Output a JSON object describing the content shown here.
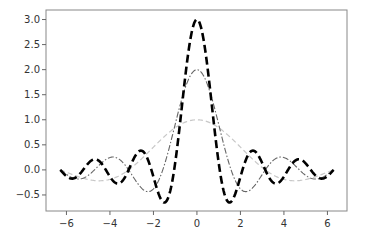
{
  "chart_data": {
    "type": "line",
    "title": "",
    "xlabel": "",
    "ylabel": "",
    "xlim": [
      -6.94,
      6.9
    ],
    "ylim": [
      -0.82,
      3.19
    ],
    "grid": false,
    "legend": null,
    "x_ticks": [
      -6,
      -4,
      -2,
      0,
      2,
      4,
      6
    ],
    "x_tick_labels": [
      "−6",
      "−4",
      "−2",
      "0",
      "2",
      "4",
      "6"
    ],
    "y_ticks": [
      -0.5,
      0.0,
      0.5,
      1.0,
      1.5,
      2.0,
      2.5,
      3.0
    ],
    "y_tick_labels": [
      "−0.5",
      "0.0",
      "0.5",
      "1.0",
      "1.5",
      "2.0",
      "2.5",
      "3.0"
    ],
    "x_range": [
      -6.2832,
      6.2832
    ],
    "series": [
      {
        "name": "sin(x)/x",
        "style": "dashed",
        "color": "#c8c8c8",
        "linewidth": 1.2,
        "dasharray": "5,3",
        "function": "sin(1*x)/x",
        "k": 1,
        "peak": 1.0
      },
      {
        "name": "sin(2x)/x",
        "style": "dashdot",
        "color": "#666666",
        "linewidth": 1.1,
        "dasharray": "6,2,1.5,2",
        "function": "sin(2*x)/x",
        "k": 2,
        "peak": 2.0
      },
      {
        "name": "sin(3x)/x",
        "style": "dashed",
        "color": "#000000",
        "linewidth": 2.6,
        "dasharray": "8,4",
        "function": "sin(3*x)/x",
        "k": 3,
        "peak": 3.0
      }
    ],
    "sample_points": {
      "x": [
        -6.28,
        -5.5,
        -4.71,
        -3.93,
        -3.14,
        -2.36,
        -1.57,
        -1.05,
        -0.52,
        0,
        0.52,
        1.05,
        1.57,
        2.36,
        3.14,
        3.93,
        4.71,
        5.5,
        6.28
      ],
      "sin(x)/x": [
        0.0,
        -0.13,
        -0.21,
        -0.18,
        0.0,
        0.3,
        0.64,
        0.83,
        0.96,
        1.0,
        0.96,
        0.83,
        0.64,
        0.3,
        0.0,
        -0.18,
        -0.21,
        -0.13,
        0.0
      ],
      "sin(2x)/x": [
        0.0,
        0.18,
        0.0,
        -0.25,
        0.0,
        0.42,
        0.0,
        0.83,
        1.66,
        2.0,
        1.66,
        0.83,
        0.0,
        0.42,
        0.0,
        -0.25,
        0.0,
        0.18,
        0.0
      ],
      "sin(3x)/x": [
        0.0,
        -0.18,
        0.21,
        -0.18,
        0.0,
        0.3,
        -0.64,
        0.0,
        1.91,
        3.0,
        1.91,
        0.0,
        -0.64,
        0.3,
        0.0,
        -0.18,
        0.21,
        -0.18,
        0.0
      ]
    }
  },
  "plot_box": {
    "left": 46,
    "top": 10,
    "right": 347,
    "bottom": 211
  },
  "spine_color": "#888888"
}
